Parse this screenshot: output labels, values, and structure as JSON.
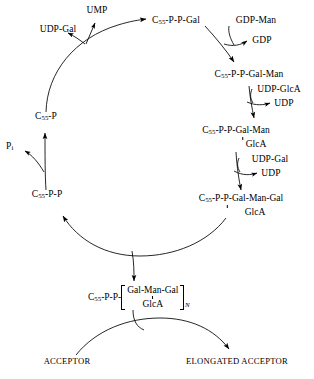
{
  "diagram": {
    "stroke_color": "#000000",
    "background": "#ffffff"
  },
  "nodes": {
    "carrier_p": "C55-P",
    "carrier_pp": "C55-P-P",
    "gal": "C55-P-P-Gal",
    "gal_man": "C55-P-P-Gal-Man",
    "gal_man_branch": "GlcA",
    "gal_man_gal": "C55-P-P-Gal-Man-Gal",
    "gal_man_gal_branch": "GlcA"
  },
  "node_parts": {
    "carrier_prefix": "C",
    "carrier_subscript": "55",
    "carrier_p_suffix": "-P",
    "carrier_pp_suffix": "-P-P",
    "gal_suffix": "-P-P-Gal",
    "gal_man_suffix": "-P-P-Gal-Man",
    "gal_man_gal_suffix": "-P-P-Gal-Man-Gal",
    "polymer_prefix_suffix": "-P-P-"
  },
  "cofactors": {
    "udp_gal_in_top": "UDP-Gal",
    "ump_out": "UMP",
    "gdp_man_in": "GDP-Man",
    "gdp_out": "GDP",
    "udp_glca_in": "UDP-GlcA",
    "udp_out_1": "UDP",
    "udp_gal_in": "UDP-Gal",
    "udp_out_2": "UDP",
    "phosphate_out": "P",
    "phosphate_subscript": "i"
  },
  "polymer": {
    "prefix": "C",
    "prefix_subscript": "55",
    "prefix_suffix": "-P-P-",
    "repeat_line1": "Gal-Man-Gal",
    "repeat_line2": "GlcA",
    "repeat_subscript": "N"
  },
  "acceptor": {
    "input": "ACCEPTOR",
    "output": "ELONGATED ACCEPTOR"
  }
}
